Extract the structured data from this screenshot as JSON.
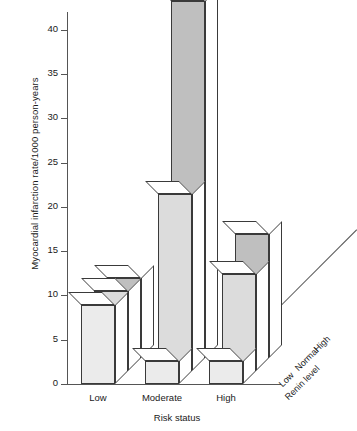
{
  "chart_data": {
    "type": "bar",
    "title": "",
    "xlabel": "Risk status",
    "ylabel": "Myocardial infarction rate/1000 person-years",
    "zlabel": "Renin level",
    "categories": [
      "Low",
      "Moderate",
      "High"
    ],
    "ytick_labels": [
      "0",
      "5",
      "10",
      "15",
      "20",
      "25",
      "30",
      "35",
      "40"
    ],
    "ytick_values": [
      0,
      5,
      10,
      15,
      20,
      25,
      30,
      35,
      40
    ],
    "ylim": [
      0,
      42
    ],
    "grid": false,
    "legend_position": "depth-axis-right",
    "series": [
      {
        "name": "Low",
        "values": [
          8.9,
          2.6,
          2.6
        ],
        "color": "#ebebeb"
      },
      {
        "name": "Normal",
        "values": [
          9.0,
          20.0,
          11.0
        ],
        "color": "#dcdcdc"
      },
      {
        "name": "High",
        "values": [
          9.0,
          40.3,
          14.0
        ],
        "color": "#bfbfbf"
      }
    ]
  },
  "colors": {
    "axis": "#555555",
    "outline": "#3a3a3a",
    "front_light": "#ebebeb",
    "mid": "#dcdcdc",
    "dark": "#bfbfbf",
    "top_face": "#ffffff"
  }
}
